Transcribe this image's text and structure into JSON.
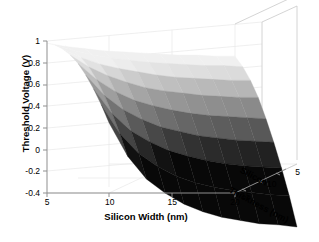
{
  "figure": {
    "background_color": "#ffffff",
    "axis_color": "#9a9a9a",
    "grid_color": "#e4e4e4",
    "text_color": "#000000"
  },
  "chart_data": {
    "type": "surface",
    "title": "",
    "xlabel": "Silicon Width (nm)",
    "ylabel": "Silicon Thickness (nm)",
    "zlabel": "Threshold Voltage (V)",
    "xlim": [
      5,
      20
    ],
    "ylim": [
      15,
      3
    ],
    "zlim": [
      -0.4,
      1.0
    ],
    "xticks": [
      5,
      10,
      15,
      20
    ],
    "xticklabels": [
      "5",
      "10",
      "15",
      "20"
    ],
    "yticks": [
      15,
      10,
      5
    ],
    "yticklabels": [
      "15",
      "10",
      "5"
    ],
    "zticks": [
      -0.4,
      -0.2,
      0,
      0.2,
      0.4,
      0.6,
      0.8,
      1
    ],
    "zticklabels": [
      "-0.4",
      "-0.2",
      "0",
      "0.2",
      "0.4",
      "0.6",
      "0.8",
      "1"
    ],
    "grid": true,
    "legend": false,
    "colormap": "gray",
    "colormap_range": [
      -0.35,
      0.75
    ],
    "x": [
      5.0,
      6.5,
      8.0,
      9.5,
      11.0,
      12.5,
      14.0,
      15.5,
      17.0,
      18.5,
      20.0
    ],
    "y": [
      15.0,
      13.5,
      12.0,
      10.5,
      9.0,
      7.5,
      6.0,
      4.5,
      3.0
    ],
    "z": [
      [
        0.98,
        0.95,
        0.93,
        0.91,
        0.9,
        0.89,
        0.88,
        0.87,
        0.87,
        0.86,
        0.86
      ],
      [
        0.93,
        0.88,
        0.84,
        0.81,
        0.79,
        0.77,
        0.76,
        0.75,
        0.74,
        0.74,
        0.73
      ],
      [
        0.86,
        0.78,
        0.72,
        0.68,
        0.65,
        0.62,
        0.6,
        0.59,
        0.58,
        0.57,
        0.57
      ],
      [
        0.77,
        0.66,
        0.58,
        0.52,
        0.47,
        0.44,
        0.42,
        0.4,
        0.39,
        0.38,
        0.38
      ],
      [
        0.66,
        0.51,
        0.4,
        0.32,
        0.27,
        0.23,
        0.2,
        0.18,
        0.17,
        0.16,
        0.15
      ],
      [
        0.52,
        0.33,
        0.2,
        0.11,
        0.04,
        0.0,
        -0.04,
        -0.06,
        -0.08,
        -0.09,
        -0.1
      ],
      [
        0.36,
        0.13,
        -0.03,
        -0.13,
        -0.21,
        -0.26,
        -0.3,
        -0.33,
        -0.35,
        -0.36,
        -0.37
      ],
      [
        0.18,
        -0.09,
        -0.27,
        -0.39,
        -0.48,
        -0.54,
        -0.58,
        -0.61,
        -0.63,
        -0.65,
        -0.66
      ],
      [
        -0.02,
        -0.33,
        -0.54,
        -0.67,
        -0.77,
        -0.84,
        -0.89,
        -0.92,
        -0.95,
        -0.96,
        -0.98
      ]
    ]
  },
  "axes": {
    "z_axis_title": "Threshold Voltage (V)",
    "x_axis_title": "Silicon Width (nm)",
    "y_axis_title_line1": "Silicon",
    "y_axis_title_line2": "Thickness (nm)"
  }
}
